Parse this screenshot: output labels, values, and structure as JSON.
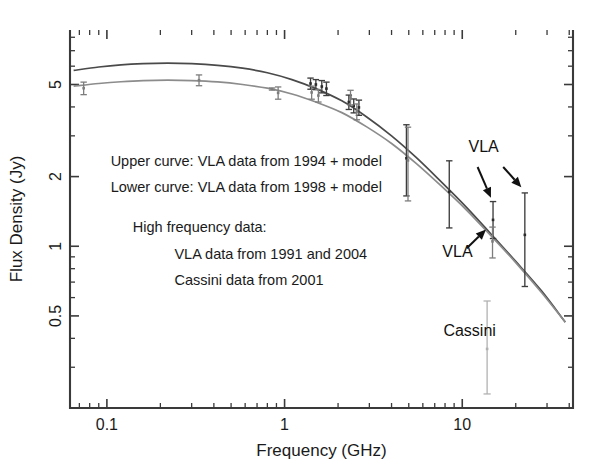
{
  "chart_data": {
    "type": "scatter",
    "title": "",
    "xlabel": "Frequency (GHz)",
    "ylabel": "Flux Density (Jy)",
    "xscale": "log",
    "yscale": "log",
    "xlim": [
      0.062,
      42
    ],
    "ylim": [
      0.2,
      8.6
    ],
    "grid": false,
    "legend_position": "none",
    "xticks": [
      0.1,
      1,
      10
    ],
    "xtick_labels": [
      "0.1",
      "1",
      "10"
    ],
    "yticks": [
      0.5,
      1,
      2,
      5
    ],
    "ytick_labels": [
      "0.5",
      "1",
      "2",
      "5"
    ],
    "annotations": [
      {
        "id": "note-upper-curve",
        "text": "Upper curve: VLA data from 1994 + model",
        "x": 0.105,
        "y": 2.22
      },
      {
        "id": "note-lower-curve",
        "text": "Lower curve: VLA data from 1998 + model",
        "x": 0.105,
        "y": 1.72
      },
      {
        "id": "note-high-freq",
        "text": "High frequency data:",
        "x": 0.14,
        "y": 1.15
      },
      {
        "id": "note-vla-years",
        "text": "VLA data from 1991 and 2004",
        "x": 0.24,
        "y": 0.88
      },
      {
        "id": "note-cassini-year",
        "text": "Cassini data from 2001",
        "x": 0.24,
        "y": 0.68
      },
      {
        "id": "label-vla-top",
        "text": "VLA",
        "x": 13.2,
        "y": 2.55
      },
      {
        "id": "label-vla-bottom",
        "text": "VLA",
        "x": 9.4,
        "y": 0.9
      },
      {
        "id": "label-cassini",
        "text": "Cassini",
        "x": 11.0,
        "y": 0.41
      }
    ],
    "series": [
      {
        "name": "VLA data from 1994 + model (upper curve)",
        "kind": "model-curve",
        "color": "#4a4a4a",
        "points": [
          {
            "x": 0.065,
            "y": 5.75
          },
          {
            "x": 0.09,
            "y": 5.95
          },
          {
            "x": 0.12,
            "y": 6.08
          },
          {
            "x": 0.16,
            "y": 6.15
          },
          {
            "x": 0.22,
            "y": 6.18
          },
          {
            "x": 0.3,
            "y": 6.15
          },
          {
            "x": 0.42,
            "y": 6.05
          },
          {
            "x": 0.58,
            "y": 5.88
          },
          {
            "x": 0.8,
            "y": 5.62
          },
          {
            "x": 1.1,
            "y": 5.25
          },
          {
            "x": 1.5,
            "y": 4.8
          },
          {
            "x": 2.1,
            "y": 4.25
          },
          {
            "x": 2.9,
            "y": 3.62
          },
          {
            "x": 4.0,
            "y": 3.0
          },
          {
            "x": 5.5,
            "y": 2.42
          },
          {
            "x": 7.5,
            "y": 1.92
          },
          {
            "x": 10.5,
            "y": 1.48
          },
          {
            "x": 14.5,
            "y": 1.13
          },
          {
            "x": 20.0,
            "y": 0.86
          },
          {
            "x": 28.0,
            "y": 0.64
          },
          {
            "x": 38.0,
            "y": 0.47
          }
        ]
      },
      {
        "name": "VLA data from 1998 + model (lower curve)",
        "kind": "model-curve",
        "color": "#8c8c8c",
        "points": [
          {
            "x": 0.065,
            "y": 4.92
          },
          {
            "x": 0.09,
            "y": 5.05
          },
          {
            "x": 0.12,
            "y": 5.14
          },
          {
            "x": 0.16,
            "y": 5.2
          },
          {
            "x": 0.22,
            "y": 5.22
          },
          {
            "x": 0.3,
            "y": 5.2
          },
          {
            "x": 0.42,
            "y": 5.13
          },
          {
            "x": 0.58,
            "y": 5.0
          },
          {
            "x": 0.8,
            "y": 4.82
          },
          {
            "x": 1.1,
            "y": 4.55
          },
          {
            "x": 1.5,
            "y": 4.2
          },
          {
            "x": 2.1,
            "y": 3.78
          },
          {
            "x": 2.9,
            "y": 3.28
          },
          {
            "x": 4.0,
            "y": 2.78
          },
          {
            "x": 5.5,
            "y": 2.28
          },
          {
            "x": 7.5,
            "y": 1.84
          },
          {
            "x": 10.5,
            "y": 1.44
          },
          {
            "x": 14.5,
            "y": 1.11
          },
          {
            "x": 20.0,
            "y": 0.85
          },
          {
            "x": 28.0,
            "y": 0.63
          },
          {
            "x": 38.0,
            "y": 0.47
          }
        ]
      },
      {
        "name": "VLA 1994 measurements",
        "kind": "errorbar",
        "color": "#2b2b2b",
        "points": [
          {
            "x": 1.4,
            "y": 5.05,
            "yerr_lo": 0.28,
            "yerr_hi": 0.28
          },
          {
            "x": 1.5,
            "y": 5.0,
            "yerr_lo": 0.25,
            "yerr_hi": 0.25
          },
          {
            "x": 1.62,
            "y": 4.9,
            "yerr_lo": 0.3,
            "yerr_hi": 0.3
          },
          {
            "x": 1.72,
            "y": 4.8,
            "yerr_lo": 0.32,
            "yerr_hi": 0.32
          },
          {
            "x": 2.3,
            "y": 4.2,
            "yerr_lo": 0.3,
            "yerr_hi": 0.3
          },
          {
            "x": 2.45,
            "y": 4.05,
            "yerr_lo": 0.28,
            "yerr_hi": 0.28
          },
          {
            "x": 2.62,
            "y": 3.98,
            "yerr_lo": 0.3,
            "yerr_hi": 0.3
          },
          {
            "x": 4.85,
            "y": 2.4,
            "yerr_lo": 0.75,
            "yerr_hi": 0.95
          },
          {
            "x": 8.45,
            "y": 1.72,
            "yerr_lo": 0.52,
            "yerr_hi": 0.62
          },
          {
            "x": 14.9,
            "y": 1.3,
            "yerr_lo": 0.22,
            "yerr_hi": 0.26
          },
          {
            "x": 22.5,
            "y": 1.12,
            "yerr_lo": 0.45,
            "yerr_hi": 0.58
          }
        ]
      },
      {
        "name": "VLA 1998 measurements",
        "kind": "errorbar",
        "color": "#7d7d7d",
        "points": [
          {
            "x": 0.074,
            "y": 4.82,
            "yerr_lo": 0.3,
            "yerr_hi": 0.3
          },
          {
            "x": 0.33,
            "y": 5.22,
            "yerr_lo": 0.28,
            "yerr_hi": 0.28
          },
          {
            "x": 0.85,
            "y": 4.78,
            "yerr_lo": 0.05,
            "yerr_hi": 0.05
          },
          {
            "x": 0.92,
            "y": 4.6,
            "yerr_lo": 0.28,
            "yerr_hi": 0.28
          },
          {
            "x": 1.42,
            "y": 4.62,
            "yerr_lo": 0.3,
            "yerr_hi": 0.3
          },
          {
            "x": 1.55,
            "y": 4.48,
            "yerr_lo": 0.28,
            "yerr_hi": 0.28
          },
          {
            "x": 2.35,
            "y": 4.4,
            "yerr_lo": 0.32,
            "yerr_hi": 0.32
          },
          {
            "x": 2.55,
            "y": 3.82,
            "yerr_lo": 0.3,
            "yerr_hi": 0.3
          },
          {
            "x": 4.95,
            "y": 2.35,
            "yerr_lo": 0.78,
            "yerr_hi": 0.92
          },
          {
            "x": 14.8,
            "y": 1.05,
            "yerr_lo": 0.16,
            "yerr_hi": 0.16
          }
        ]
      },
      {
        "name": "Cassini data from 2001",
        "kind": "errorbar",
        "color": "#b0b0b0",
        "points": [
          {
            "x": 13.8,
            "y": 0.36,
            "yerr_lo": 0.13,
            "yerr_hi": 0.22
          }
        ]
      }
    ],
    "pointers": [
      {
        "id": "arrow-vla-top-left",
        "from": {
          "x": 12.2,
          "y": 2.2
        },
        "to": {
          "x": 14.5,
          "y": 1.62
        }
      },
      {
        "id": "arrow-vla-top-right",
        "from": {
          "x": 17.0,
          "y": 2.2
        },
        "to": {
          "x": 21.5,
          "y": 1.8
        }
      },
      {
        "id": "arrow-vla-bottom",
        "from": {
          "x": 10.6,
          "y": 0.98
        },
        "to": {
          "x": 13.6,
          "y": 1.18
        }
      }
    ]
  }
}
